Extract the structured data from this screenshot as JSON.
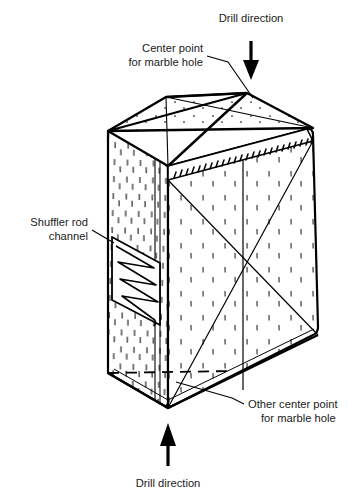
{
  "figure": {
    "kind": "isometric-technical-diagram",
    "background_color": "#ffffff",
    "line_color": "#000000",
    "text_color": "#1a1a1a"
  },
  "labels": {
    "drill_direction_top": {
      "line1": "Drill direction",
      "x": 251,
      "y": 22,
      "anchor": "middle"
    },
    "center_point_top": {
      "line1": "Center point",
      "line2": "for marble hole",
      "x": 203,
      "y": 52,
      "line_height": 14,
      "anchor": "end"
    },
    "shuffler_rod_channel": {
      "line1": "Shuffler rod",
      "line2": "channel",
      "x": 88,
      "y": 226,
      "line_height": 14,
      "anchor": "end"
    },
    "other_center_point": {
      "line1": "Other center point",
      "line2": "for marble hole",
      "x": 248,
      "y": 408,
      "line_height": 14,
      "anchor": "start"
    },
    "drill_direction_bottom": {
      "line1": "Drill direction",
      "x": 168,
      "y": 487,
      "anchor": "middle"
    }
  },
  "arrows": {
    "top": {
      "name": "drill-direction-arrow-down",
      "direction": "down",
      "x": 251,
      "y_start": 41,
      "y_end": 80
    },
    "bottom": {
      "name": "drill-direction-arrow-up",
      "direction": "up",
      "x": 168,
      "y_start": 466,
      "y_end": 423
    }
  },
  "geometry": {
    "top_face": {
      "points": "108,131 166,97 247,93 313,128",
      "center_point": [
        212,
        117
      ]
    },
    "left_face": {
      "points": "108,131 168,100 168,378 108,373"
    },
    "front_face": {
      "points": "108,131 168,166 168,408 108,373"
    },
    "right_face": {
      "points": "168,166 313,128 318,333 168,408",
      "center_point": [
        243,
        269
      ]
    },
    "bevel_strip": {
      "points": "168,166 313,128 313,141 168,180",
      "hatch_count": 26
    },
    "channel": {
      "points": "112,237 160,226 160,288 112,300",
      "zigzag_segments": 4
    },
    "dashed_line": {
      "x1": 108,
      "y1": 373,
      "x2": 232,
      "y2": 371
    }
  },
  "leaders": {
    "center_point_top": [
      {
        "x1": 207,
        "y1": 56,
        "x2": 228,
        "y2": 62
      },
      {
        "x1": 228,
        "y1": 62,
        "x2": 253,
        "y2": 98
      }
    ],
    "shuffler_rod_channel": [
      {
        "x1": 92,
        "y1": 230,
        "x2": 112,
        "y2": 242
      }
    ],
    "other_center_point": [
      {
        "x1": 244,
        "y1": 404,
        "x2": 232,
        "y2": 398
      },
      {
        "x1": 232,
        "y1": 398,
        "x2": 176,
        "y2": 382
      }
    ]
  },
  "textures": {
    "speckle_name": "concrete-stipple-texture",
    "description": "short vertical dashes and dots representing concrete aggregate"
  }
}
